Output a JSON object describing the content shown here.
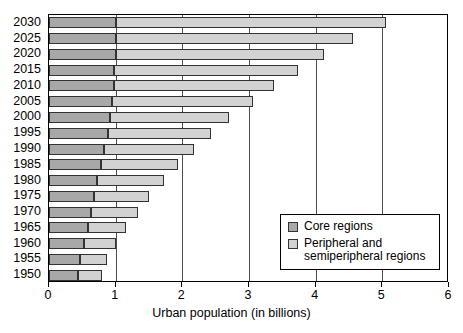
{
  "chart_data": {
    "type": "bar",
    "orientation": "horizontal",
    "stacked": true,
    "title": "",
    "xlabel": "Urban population (in billions)",
    "ylabel": "",
    "xlim": [
      0,
      6
    ],
    "ylim": null,
    "grid": true,
    "grid_axis": "x",
    "legend_position": "inside-lower-right",
    "xticks": [
      0,
      1,
      2,
      3,
      4,
      5,
      6
    ],
    "xticklabels": [
      "0",
      "1",
      "2",
      "3",
      "4",
      "5",
      "6"
    ],
    "categories": [
      "2030",
      "2025",
      "2020",
      "2015",
      "2010",
      "2005",
      "2000",
      "1995",
      "1990",
      "1985",
      "1980",
      "1975",
      "1970",
      "1965",
      "1960",
      "1955",
      "1950"
    ],
    "series": [
      {
        "name": "Core regions",
        "color": "#a8a8a8",
        "values": [
          1.01,
          1.0,
          1.0,
          0.98,
          0.97,
          0.95,
          0.92,
          0.88,
          0.82,
          0.78,
          0.72,
          0.68,
          0.63,
          0.59,
          0.52,
          0.46,
          0.43
        ]
      },
      {
        "name": "Peripheral and semiperipheral regions",
        "color": "#d2d2d2",
        "values": [
          4.04,
          3.56,
          3.12,
          2.75,
          2.4,
          2.11,
          1.78,
          1.55,
          1.35,
          1.15,
          1.0,
          0.82,
          0.7,
          0.57,
          0.48,
          0.41,
          0.37
        ]
      }
    ],
    "totals": [
      5.05,
      4.56,
      4.12,
      3.73,
      3.37,
      3.06,
      2.7,
      2.43,
      2.17,
      1.93,
      1.72,
      1.5,
      1.33,
      1.16,
      1.0,
      0.87,
      0.8
    ]
  },
  "legend": {
    "items": [
      {
        "label": "Core regions",
        "color": "#a8a8a8",
        "swatch": "core"
      },
      {
        "label": "Peripheral and\nsemiperipheral regions",
        "color": "#d2d2d2",
        "swatch": "periph"
      }
    ]
  },
  "axis": {
    "x_title": "Urban population (in billions)"
  },
  "colors": {
    "core": "#a8a8a8",
    "peripheral": "#d2d2d2",
    "outline": "#333333",
    "frame": "#000000",
    "gridline": "#4d4d4d",
    "background": "#ffffff"
  }
}
